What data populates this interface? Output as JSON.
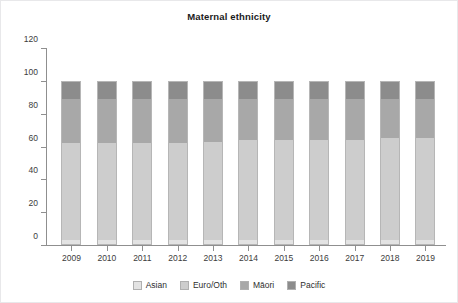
{
  "chart_data": {
    "type": "bar",
    "stacked": true,
    "title": "Maternal ethnicity",
    "xlabel": "",
    "ylabel": "",
    "ylim": [
      0,
      120
    ],
    "yticks": [
      0,
      20,
      40,
      60,
      80,
      100,
      120
    ],
    "grid": false,
    "legend_position": "bottom",
    "categories": [
      "2009",
      "2010",
      "2011",
      "2012",
      "2013",
      "2014",
      "2015",
      "2016",
      "2017",
      "2018",
      "2019"
    ],
    "series": [
      {
        "name": "Asian",
        "color": "#e3e3e3",
        "values": [
          3,
          3,
          3,
          3,
          3,
          3,
          3,
          3,
          3,
          3,
          3
        ]
      },
      {
        "name": "Euro/Oth",
        "color": "#cdcdcd",
        "values": [
          59,
          59,
          59,
          59,
          60,
          61,
          61,
          61,
          61,
          62,
          62
        ]
      },
      {
        "name": "Māori",
        "color": "#a8a8a8",
        "values": [
          27,
          27,
          27,
          27,
          26,
          25,
          25,
          25,
          25,
          24,
          24
        ]
      },
      {
        "name": "Pacific",
        "color": "#8c8c8c",
        "values": [
          11,
          11,
          11,
          11,
          11,
          11,
          11,
          11,
          11,
          11,
          11
        ]
      }
    ]
  },
  "legend": {
    "items": [
      {
        "label": "Asian"
      },
      {
        "label": "Euro/Oth"
      },
      {
        "label": "Māori"
      },
      {
        "label": "Pacific"
      }
    ]
  },
  "colors": {
    "axis": "#8f8f8f",
    "text": "#3c3c3c",
    "title": "#1b1b1b",
    "border": "#e8e8ea",
    "bar_outline": "#b6b6b6",
    "background": "#ffffff"
  }
}
